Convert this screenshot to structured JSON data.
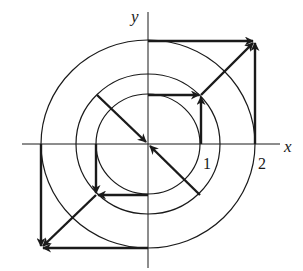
{
  "figure": {
    "type": "vector-field-diagram",
    "axes": {
      "x_label": "x",
      "y_label": "y",
      "tick_labels": [
        "1",
        "2"
      ]
    },
    "circles": [
      {
        "name": "inner",
        "radius_units": 1
      },
      {
        "name": "middle",
        "radius_units": 1.4
      },
      {
        "name": "outer",
        "radius_units": 2
      }
    ],
    "vectors": [
      {
        "from": "(0,2)",
        "to": "(2,2)",
        "desc": "horizontal arrow at top of outer circle pointing right"
      },
      {
        "from": "(2,0)",
        "to": "(2,2)",
        "desc": "vertical arrow at right of outer circle pointing up"
      },
      {
        "from": "(1,1)",
        "to": "(2,2)",
        "desc": "diagonal arrow pointing outward up-right"
      },
      {
        "from": "(0,1)",
        "to": "(1,1)",
        "desc": "horizontal arrow at top of inner circle pointing right"
      },
      {
        "from": "(1,0)",
        "to": "(1,1)",
        "desc": "vertical arrow at right of inner circle pointing up"
      },
      {
        "from": "(-1,1)",
        "to": "(0,0)",
        "desc": "diagonal arrow pointing to origin from upper-left"
      },
      {
        "from": "(1,-1)",
        "to": "(0,0)",
        "desc": "diagonal arrow pointing to origin from lower-right"
      },
      {
        "from": "(-1,0)",
        "to": "(-1,-1)",
        "desc": "vertical arrow at left of inner circle pointing down"
      },
      {
        "from": "(0,-1)",
        "to": "(-1,-1)",
        "desc": "horizontal arrow at bottom of inner circle pointing left"
      },
      {
        "from": "(-1,-1)",
        "to": "(-2,-2)",
        "desc": "diagonal arrow pointing outward down-left"
      },
      {
        "from": "(-2,0)",
        "to": "(-2,-2)",
        "desc": "vertical arrow at left of outer circle pointing down"
      },
      {
        "from": "(0,-2)",
        "to": "(-2,-2)",
        "desc": "horizontal arrow at bottom of outer circle pointing left"
      }
    ],
    "colors": {
      "ink": "#1a1a1a",
      "background": "#ffffff"
    }
  }
}
